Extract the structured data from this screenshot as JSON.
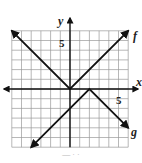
{
  "chart_data": {
    "type": "line",
    "title": "",
    "xlabel": "x",
    "ylabel": "y",
    "xlim": [
      -6,
      6
    ],
    "ylim": [
      -6,
      6
    ],
    "grid": true,
    "tick_labels": {
      "x": [
        "5"
      ],
      "y": [
        "5"
      ]
    },
    "series": [
      {
        "name": "f",
        "expression": "f(x) = |x|",
        "x": [
          -6,
          0,
          6
        ],
        "y": [
          6,
          0,
          6
        ],
        "arrows": "both"
      },
      {
        "name": "g",
        "expression": "g(x) = -|x - 2|",
        "x": [
          -4,
          2,
          6
        ],
        "y": [
          -6,
          0,
          -4
        ],
        "arrows": "both"
      }
    ],
    "legend": "inline labels at right end of each curve"
  },
  "labels": {
    "x_axis": "x",
    "y_axis": "y",
    "x_tick": "5",
    "y_tick": "5",
    "f": "f",
    "g": "g"
  },
  "colors": {
    "grid": "#9a9a9a",
    "axes": "#111111",
    "curves": "#111111"
  }
}
